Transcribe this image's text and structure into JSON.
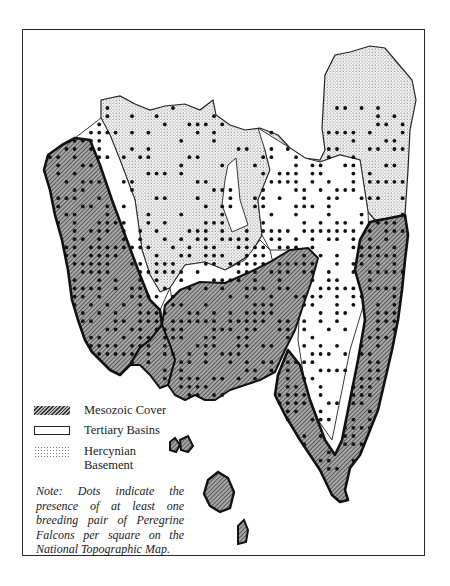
{
  "figure": {
    "type": "thematic geological map",
    "legend": {
      "items": [
        {
          "pattern": "hatched",
          "label": "Mesozoic Cover"
        },
        {
          "pattern": "plain",
          "label": "Tertiary Basins"
        },
        {
          "pattern": "stippled",
          "label_line1": "Hercynian",
          "label_line2": "Basement"
        }
      ]
    },
    "note": "Note: Dots indicate the presence of at least one breeding pair of Peregrine Falcons per square on the National Topographic Map.",
    "colors": {
      "ink": "#1a1a1a",
      "hatch_fill": "#9a9a9a",
      "stipple": "#777777",
      "background": "#ffffff"
    }
  }
}
